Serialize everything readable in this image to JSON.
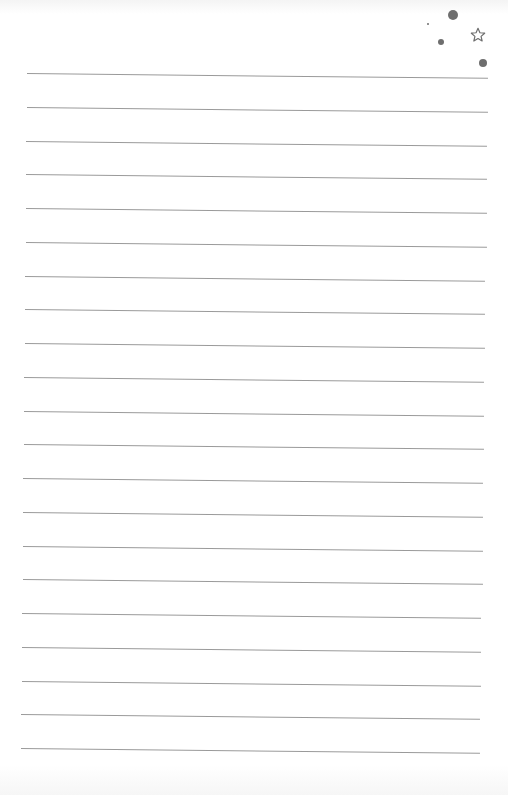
{
  "page": {
    "type": "lined-notepaper",
    "line_color": "#9a9a9a",
    "line_count": 21,
    "lines_start_y": 73,
    "line_spacing": 33.75
  },
  "decorations": {
    "dots": [
      {
        "x": 453,
        "y": 15,
        "r": 5
      },
      {
        "x": 428,
        "y": 24,
        "r": 1
      },
      {
        "x": 441,
        "y": 42,
        "r": 3
      },
      {
        "x": 483,
        "y": 63,
        "r": 4
      }
    ],
    "star": {
      "x": 470,
      "y": 27,
      "size": 16,
      "symbol": "star-outline"
    }
  }
}
